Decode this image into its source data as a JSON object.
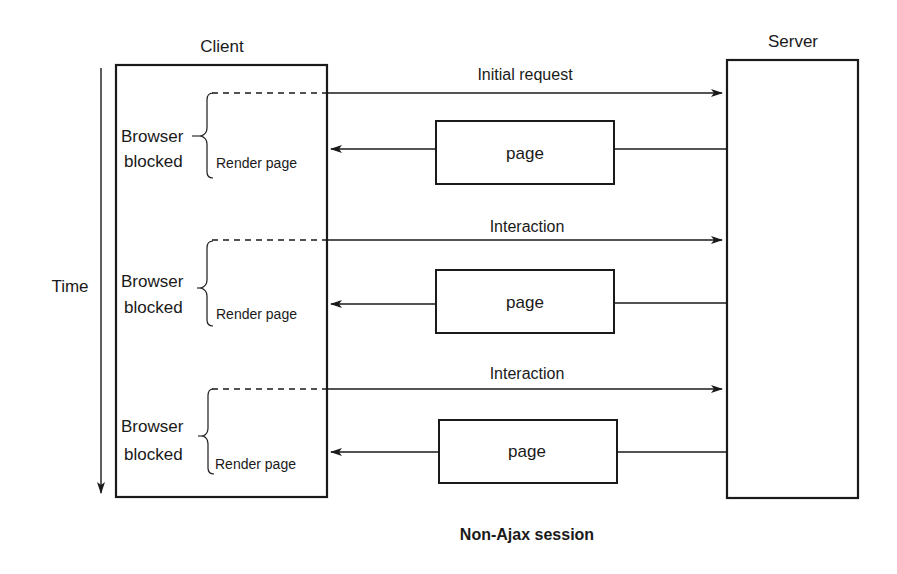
{
  "diagram": {
    "caption": "Non-Ajax session",
    "time_label": "Time",
    "client": {
      "label": "Client"
    },
    "server": {
      "label": "Server"
    },
    "exchanges": [
      {
        "request_label": "Initial request",
        "response_label": "page",
        "blocked_label_line1": "Browser",
        "blocked_label_line2": "blocked",
        "render_label": "Render page"
      },
      {
        "request_label": "Interaction",
        "response_label": "page",
        "blocked_label_line1": "Browser",
        "blocked_label_line2": "blocked",
        "render_label": "Render page"
      },
      {
        "request_label": "Interaction",
        "response_label": "page",
        "blocked_label_line1": "Browser",
        "blocked_label_line2": "blocked",
        "render_label": "Render page"
      }
    ]
  }
}
